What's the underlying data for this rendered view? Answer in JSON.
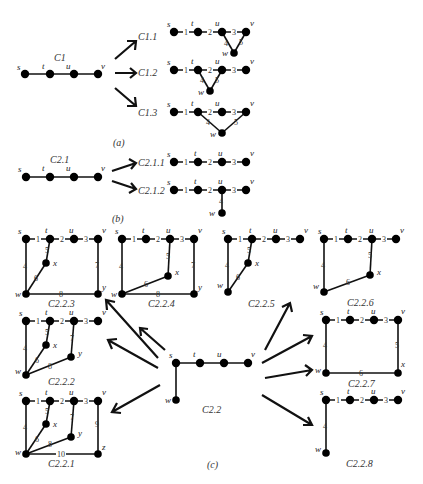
{
  "figure": {
    "panels": [
      {
        "id": "a",
        "label": "(a)",
        "source": {
          "name": "C1",
          "vertices": [
            "s",
            "t",
            "u",
            "v"
          ]
        },
        "targets": [
          {
            "name": "C1.1",
            "edges": [
              "s-t:1",
              "t-u:2",
              "u-v:3",
              "u-w:4",
              "v-w:5"
            ]
          },
          {
            "name": "C1.2",
            "edges": [
              "s-t:1",
              "t-u:2",
              "u-v:3",
              "t-w:4",
              "u-w:5"
            ]
          },
          {
            "name": "C1.3",
            "edges": [
              "s-t:1",
              "t-u:2",
              "u-v:3",
              "t-w:4",
              "v-w:5"
            ]
          }
        ]
      },
      {
        "id": "b",
        "label": "(b)",
        "source": {
          "name": "C2.1",
          "vertices": [
            "s",
            "t",
            "u",
            "v"
          ]
        },
        "targets": [
          {
            "name": "C2.1.1",
            "edges": [
              "s-t:1",
              "t-u:2",
              "u-v:3"
            ]
          },
          {
            "name": "C2.1.2",
            "edges": [
              "s-t:1",
              "t-u:2",
              "u-v:3",
              "u-w:4"
            ]
          }
        ]
      },
      {
        "id": "c",
        "label": "(c)",
        "source": {
          "name": "C2.2",
          "vertices": [
            "s",
            "t",
            "u",
            "v",
            "w"
          ]
        },
        "targets": [
          {
            "name": "C2.2.1"
          },
          {
            "name": "C2.2.2"
          },
          {
            "name": "C2.2.3"
          },
          {
            "name": "C2.2.4"
          },
          {
            "name": "C2.2.5"
          },
          {
            "name": "C2.2.6"
          },
          {
            "name": "C2.2.7"
          },
          {
            "name": "C2.2.8"
          }
        ]
      }
    ],
    "labels": {
      "a": "(a)",
      "b": "(b)",
      "c": "(c)",
      "C1": "C1",
      "C1_1": "C1.1",
      "C1_2": "C1.2",
      "C1_3": "C1.3",
      "C2_1": "C2.1",
      "C2_1_1": "C2.1.1",
      "C2_1_2": "C2.1.2",
      "C2_2": "C2.2",
      "C2_2_1": "C2.2.1",
      "C2_2_2": "C2.2.2",
      "C2_2_3": "C2.2.3",
      "C2_2_4": "C2.2.4",
      "C2_2_5": "C2.2.5",
      "C2_2_6": "C2.2.6",
      "C2_2_7": "C2.2.7",
      "C2_2_8": "C2.2.8"
    },
    "vertex_names": {
      "s": "s",
      "t": "t",
      "u": "u",
      "v": "v",
      "w": "w",
      "x": "x",
      "y": "y",
      "z": "z"
    },
    "edge_numbers": {
      "e1": "1",
      "e2": "2",
      "e3": "3",
      "e4": "4",
      "e5": "5",
      "e6": "6",
      "e7": "7",
      "e8": "8",
      "e9": "9",
      "e10": "10"
    }
  }
}
